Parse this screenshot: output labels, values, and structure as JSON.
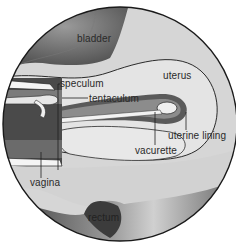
{
  "diagram": {
    "type": "anatomical-cross-section",
    "labels": {
      "bladder": "bladder",
      "speculum": "speculum",
      "tentaculum": "tentaculum",
      "uterus": "uterus",
      "uterine_lining": "uterine lining",
      "vacurette": "vacurette",
      "vagina": "vagina",
      "rectum": "rectum"
    },
    "colors": {
      "background": "#ffffff",
      "tissue_light": "#d4d4d4",
      "tissue_mid": "#bdbdbd",
      "organ_dark": "#6e6e6e",
      "outline": "#1e1e1e",
      "instrument": "#f0f0f0"
    }
  }
}
